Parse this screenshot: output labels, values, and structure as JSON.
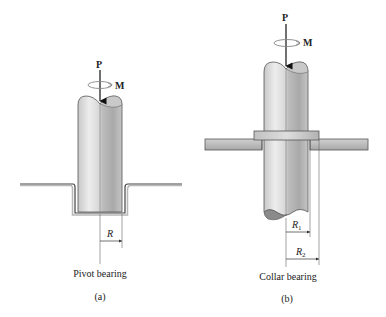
{
  "figure_a": {
    "force_label": "P",
    "moment_label": "M",
    "radius_label": "R",
    "caption": "Pivot bearing",
    "tag": "(a)"
  },
  "figure_b": {
    "force_label": "P",
    "moment_label": "M",
    "radius1_label": "R",
    "radius1_sub": "1",
    "radius2_label": "R",
    "radius2_sub": "2",
    "caption": "Collar bearing",
    "tag": "(b)"
  },
  "colors": {
    "shaft_light": "#e6e6e6",
    "shaft_dark": "#9a9a9a",
    "plate": "#b8b8b8",
    "outline": "#555555",
    "moment_arrow": "#888888"
  }
}
